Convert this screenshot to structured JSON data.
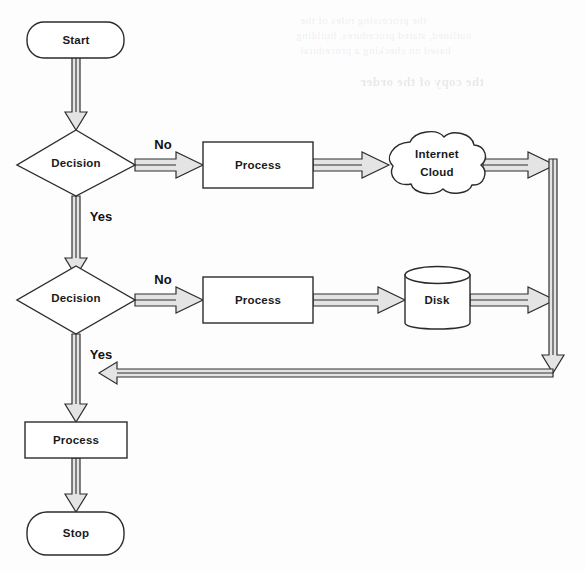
{
  "document": {
    "type": "flowchart",
    "title": "Flowchart with Decisions, Internet Cloud and Disk",
    "background_color": "#fdfdfd",
    "line_color": "#2b2b2b",
    "arrow_fill_color": "#e4e4e4",
    "text_color": "#1a1a1a"
  },
  "nodes": {
    "start": {
      "label": "Start",
      "shape": "rounded-terminator"
    },
    "decision1": {
      "label": "Decision",
      "shape": "diamond"
    },
    "process1": {
      "label": "Process",
      "shape": "rectangle"
    },
    "cloud": {
      "label_line1": "Internet",
      "label_line2": "Cloud",
      "label": "Internet Cloud",
      "shape": "cloud"
    },
    "decision2": {
      "label": "Decision",
      "shape": "diamond"
    },
    "process2": {
      "label": "Process",
      "shape": "rectangle"
    },
    "disk": {
      "label": "Disk",
      "shape": "cylinder"
    },
    "process3": {
      "label": "Process",
      "shape": "rectangle"
    },
    "stop": {
      "label": "Stop",
      "shape": "rounded-terminator"
    }
  },
  "edge_labels": {
    "decision1_no": "No",
    "decision1_yes": "Yes",
    "decision2_no": "No",
    "decision2_yes": "Yes"
  },
  "edges": [
    {
      "from": "start",
      "to": "decision1",
      "label": "",
      "direction": "down"
    },
    {
      "from": "decision1",
      "to": "process1",
      "label": "No",
      "direction": "right"
    },
    {
      "from": "process1",
      "to": "cloud",
      "label": "",
      "direction": "right"
    },
    {
      "from": "cloud",
      "to": "return-bus",
      "label": "",
      "direction": "right"
    },
    {
      "from": "decision1",
      "to": "decision2",
      "label": "Yes",
      "direction": "down"
    },
    {
      "from": "decision2",
      "to": "process2",
      "label": "No",
      "direction": "right"
    },
    {
      "from": "process2",
      "to": "disk",
      "label": "",
      "direction": "right"
    },
    {
      "from": "disk",
      "to": "return-bus",
      "label": "",
      "direction": "right"
    },
    {
      "from": "return-bus",
      "to": "process3",
      "label": "",
      "direction": "left"
    },
    {
      "from": "decision2",
      "to": "process3",
      "label": "Yes",
      "direction": "down"
    },
    {
      "from": "process3",
      "to": "stop",
      "label": "",
      "direction": "down"
    }
  ],
  "background_text": {
    "note": "faint mirrored bleed-through text from the reverse of the scanned page",
    "lines": [
      "the processing rules of the",
      "outlined, stated procedures, building",
      "based on checking a procedural",
      "the copy of the order"
    ]
  }
}
